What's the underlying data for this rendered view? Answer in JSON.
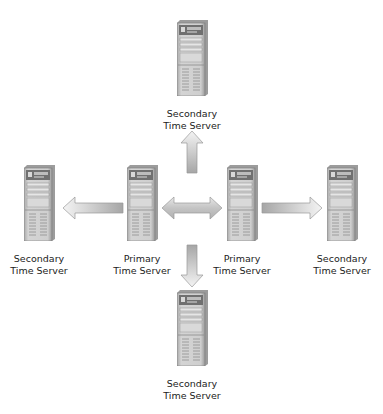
{
  "diagram": {
    "type": "time-server-hierarchy",
    "colors": {
      "server_body": "#c9c9c9",
      "server_top_panel": "#7b7b7b",
      "arrow_light": "#f2f2f2",
      "arrow_dark": "#a8a8a8",
      "text": "#222222"
    },
    "nodes": [
      {
        "id": "secondary-top",
        "role": "secondary",
        "label_line1": "Secondary",
        "label_line2": "Time Server"
      },
      {
        "id": "secondary-left",
        "role": "secondary",
        "label_line1": "Secondary",
        "label_line2": "Time Server"
      },
      {
        "id": "primary-left",
        "role": "primary",
        "label_line1": "Primary",
        "label_line2": "Time Server"
      },
      {
        "id": "primary-right",
        "role": "primary",
        "label_line1": "Primary",
        "label_line2": "Time Server"
      },
      {
        "id": "secondary-right",
        "role": "secondary",
        "label_line1": "Secondary",
        "label_line2": "Time Server"
      },
      {
        "id": "secondary-bottom",
        "role": "secondary",
        "label_line1": "Secondary",
        "label_line2": "Time Server"
      }
    ],
    "edges": [
      {
        "from": "primary-left",
        "to": "secondary-left",
        "direction": "left"
      },
      {
        "from": "primary-left",
        "to": "primary-right",
        "direction": "bidirectional"
      },
      {
        "from": "primary-right",
        "to": "secondary-right",
        "direction": "right"
      },
      {
        "from": "center",
        "to": "secondary-top",
        "direction": "up"
      },
      {
        "from": "center",
        "to": "secondary-bottom",
        "direction": "down"
      }
    ]
  }
}
